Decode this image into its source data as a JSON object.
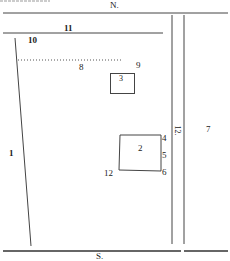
{
  "diagram": {
    "type": "site-plan",
    "top_fragment": "",
    "compass": {
      "north": "N.",
      "south": "S."
    },
    "labels": [
      {
        "id": "1",
        "text": "1",
        "x": 9,
        "y": 149
      },
      {
        "id": "2",
        "text": "2",
        "x": 138,
        "y": 148
      },
      {
        "id": "3",
        "text": "3",
        "x": 119,
        "y": 76
      },
      {
        "id": "4",
        "text": "4",
        "x": 162,
        "y": 135
      },
      {
        "id": "5",
        "text": "5",
        "x": 162,
        "y": 151
      },
      {
        "id": "6",
        "text": "6",
        "x": 162,
        "y": 169
      },
      {
        "id": "7",
        "text": "7",
        "x": 206,
        "y": 126
      },
      {
        "id": "8",
        "text": "8",
        "x": 79,
        "y": 63
      },
      {
        "id": "9",
        "text": "9",
        "x": 136,
        "y": 62
      },
      {
        "id": "10",
        "text": "10",
        "x": 28,
        "y": 36
      },
      {
        "id": "11",
        "text": "11",
        "x": 64,
        "y": 24
      },
      {
        "id": "12",
        "text": "12",
        "x": 104,
        "y": 169
      },
      {
        "id": "12-road",
        "text": "12.",
        "x": 173,
        "y": 126,
        "rotated": true
      }
    ],
    "line_color": "#333333"
  }
}
